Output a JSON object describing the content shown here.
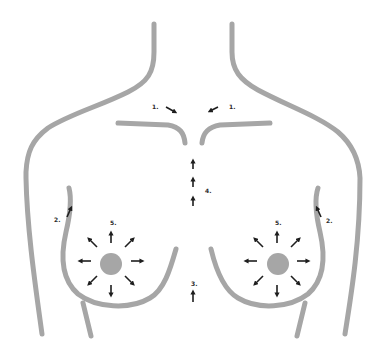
{
  "diagram": {
    "title": "",
    "colors": {
      "outline": "#a6a6a6",
      "nipple": "#a6a6a6",
      "arrow": "#1e1e1e",
      "label": "#2a2a2a",
      "background": "#ffffff"
    },
    "labels": {
      "clavicle_left": "1.",
      "clavicle_right": "1.",
      "armpit_left": "2.",
      "armpit_right": "2.",
      "below_breasts": "3.",
      "sternum": "4.",
      "breast_left": "5.",
      "breast_right": "5."
    },
    "arrow_groups": [
      {
        "name": "clavicle-arrows",
        "label_ref": "1.",
        "count": 2,
        "direction": "inward-toward-sternal-notch"
      },
      {
        "name": "armpit-arrows",
        "label_ref": "2.",
        "count": 2,
        "direction": "up-toward-armpit"
      },
      {
        "name": "lower-center-arrow",
        "label_ref": "3.",
        "count": 1,
        "direction": "up"
      },
      {
        "name": "sternum-arrows",
        "label_ref": "4.",
        "count": 3,
        "direction": "up"
      },
      {
        "name": "radial-breast-arrows",
        "label_ref": "5.",
        "count": 16,
        "direction": "outward-from-nipple"
      }
    ]
  }
}
